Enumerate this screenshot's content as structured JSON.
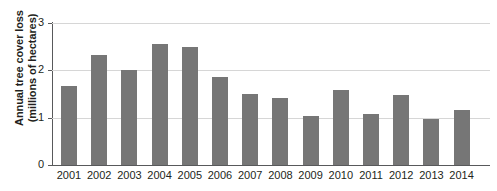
{
  "chart_data": {
    "type": "bar",
    "title": "",
    "xlabel": "",
    "ylabel": "Annual tree cover loss (millions of hectares)",
    "ylabel_lines": [
      "Annual tree cover loss",
      "(millions of hectares)"
    ],
    "categories": [
      "2001",
      "2002",
      "2003",
      "2004",
      "2005",
      "2006",
      "2007",
      "2008",
      "2009",
      "2010",
      "2011",
      "2012",
      "2013",
      "2014"
    ],
    "values": [
      1.67,
      2.33,
      2.01,
      2.56,
      2.49,
      1.86,
      1.5,
      1.42,
      1.04,
      1.59,
      1.08,
      1.48,
      0.98,
      1.17
    ],
    "ylim": [
      0,
      3
    ],
    "yticks": [
      "0",
      "1",
      "2",
      "3"
    ],
    "ytick_values": [
      0,
      1,
      2,
      3
    ],
    "grid": "horizontal",
    "legend": "none",
    "bar_color": "#767676",
    "gridline_color": "#d6d6d6",
    "axis_color": "#58595b",
    "background_color": "#ffffff"
  }
}
